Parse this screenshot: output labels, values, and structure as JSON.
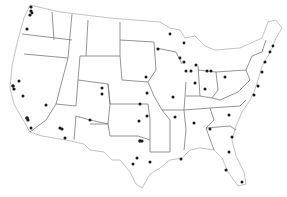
{
  "map": {
    "title": "",
    "region": "Contiguous United States",
    "style": {
      "background": "#ffffff",
      "state_fill": "#ffffff",
      "state_stroke": "#9a9a9a",
      "dot_color": "#1a1a1a"
    },
    "points": [
      {
        "x": 31,
        "y": 7,
        "r": 1.6
      },
      {
        "x": 31,
        "y": 11,
        "r": 1.6
      },
      {
        "x": 30,
        "y": 15,
        "r": 1.6
      },
      {
        "x": 32,
        "y": 13,
        "r": 1.4
      },
      {
        "x": 27,
        "y": 29,
        "r": 1.6
      },
      {
        "x": 13,
        "y": 86,
        "r": 1.8
      },
      {
        "x": 14,
        "y": 89,
        "r": 1.6
      },
      {
        "x": 19,
        "y": 81,
        "r": 1.5
      },
      {
        "x": 23,
        "y": 96,
        "r": 1.5
      },
      {
        "x": 46,
        "y": 105,
        "r": 1.5
      },
      {
        "x": 27,
        "y": 118,
        "r": 1.8
      },
      {
        "x": 28,
        "y": 120,
        "r": 1.6
      },
      {
        "x": 31,
        "y": 128,
        "r": 1.5
      },
      {
        "x": 60,
        "y": 128,
        "r": 1.6
      },
      {
        "x": 62,
        "y": 129,
        "r": 1.6
      },
      {
        "x": 65,
        "y": 138,
        "r": 1.5
      },
      {
        "x": 90,
        "y": 120,
        "r": 1.5
      },
      {
        "x": 102,
        "y": 88,
        "r": 1.5
      },
      {
        "x": 102,
        "y": 94,
        "r": 1.5
      },
      {
        "x": 146,
        "y": 77,
        "r": 1.5
      },
      {
        "x": 140,
        "y": 104,
        "r": 1.5
      },
      {
        "x": 147,
        "y": 93,
        "r": 1.5
      },
      {
        "x": 139,
        "y": 121,
        "r": 1.5
      },
      {
        "x": 147,
        "y": 116,
        "r": 1.5
      },
      {
        "x": 140,
        "y": 141,
        "r": 1.8
      },
      {
        "x": 142,
        "y": 141,
        "r": 1.6
      },
      {
        "x": 137,
        "y": 158,
        "r": 1.5
      },
      {
        "x": 133,
        "y": 164,
        "r": 1.5
      },
      {
        "x": 150,
        "y": 162,
        "r": 1.5
      },
      {
        "x": 181,
        "y": 159,
        "r": 1.5
      },
      {
        "x": 158,
        "y": 49,
        "r": 1.5
      },
      {
        "x": 170,
        "y": 34,
        "r": 1.4
      },
      {
        "x": 184,
        "y": 43,
        "r": 1.4
      },
      {
        "x": 184,
        "y": 62,
        "r": 1.5
      },
      {
        "x": 186,
        "y": 71,
        "r": 1.5
      },
      {
        "x": 173,
        "y": 97,
        "r": 1.5
      },
      {
        "x": 175,
        "y": 117,
        "r": 1.5
      },
      {
        "x": 196,
        "y": 65,
        "r": 1.5
      },
      {
        "x": 191,
        "y": 71,
        "r": 1.5
      },
      {
        "x": 207,
        "y": 71,
        "r": 1.5
      },
      {
        "x": 195,
        "y": 83,
        "r": 1.5
      },
      {
        "x": 205,
        "y": 89,
        "r": 1.5
      },
      {
        "x": 180,
        "y": 58,
        "r": 1.4
      },
      {
        "x": 225,
        "y": 77,
        "r": 1.5
      },
      {
        "x": 211,
        "y": 71,
        "r": 1.5
      },
      {
        "x": 194,
        "y": 123,
        "r": 1.5
      },
      {
        "x": 229,
        "y": 115,
        "r": 1.5
      },
      {
        "x": 210,
        "y": 129,
        "r": 1.5
      },
      {
        "x": 232,
        "y": 137,
        "r": 1.5
      },
      {
        "x": 229,
        "y": 152,
        "r": 1.5
      },
      {
        "x": 226,
        "y": 170,
        "r": 1.5
      },
      {
        "x": 242,
        "y": 182,
        "r": 1.5
      },
      {
        "x": 254,
        "y": 95,
        "r": 1.5
      },
      {
        "x": 258,
        "y": 86,
        "r": 1.5
      },
      {
        "x": 262,
        "y": 72,
        "r": 1.5
      },
      {
        "x": 265,
        "y": 62,
        "r": 1.5
      },
      {
        "x": 273,
        "y": 46,
        "r": 1.4
      },
      {
        "x": 270,
        "y": 52,
        "r": 1.4
      }
    ]
  }
}
